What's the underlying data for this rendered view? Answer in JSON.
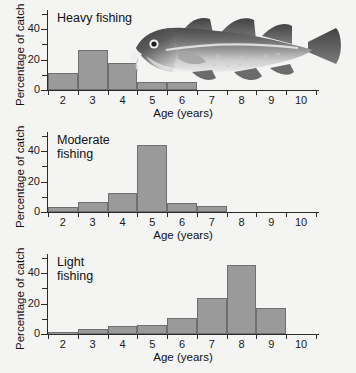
{
  "figure": {
    "background_color": "#f4f4f3",
    "bar_fill_color": "#9a9a9a",
    "bar_edge_color": "#6f6f6f",
    "axis_color": "#2b2b2b"
  },
  "photo": {
    "name": "atlantic-cod-photo",
    "description": "Grayscale photograph of an Atlantic cod"
  },
  "axis_labels": {
    "x": "Age (years)",
    "y": "Percentage of catch"
  },
  "ticks": {
    "y_major": [
      "0",
      "20",
      "40"
    ],
    "y_major_values": [
      0,
      20,
      40
    ],
    "y_minor_values": [
      10,
      30,
      50
    ],
    "x": [
      "2",
      "3",
      "4",
      "5",
      "6",
      "7",
      "8",
      "9",
      "10"
    ],
    "x_values": [
      2,
      3,
      4,
      5,
      6,
      7,
      8,
      9,
      10
    ]
  },
  "chart_data": [
    {
      "type": "bar",
      "title": "Heavy fishing",
      "name": "heavy-fishing-histogram",
      "categories": [
        2,
        3,
        4,
        5,
        6,
        7,
        8,
        9,
        10
      ],
      "values": [
        11,
        26,
        18,
        5,
        5,
        0,
        0,
        0,
        0
      ],
      "xlabel": "Age (years)",
      "ylabel": "Percentage of catch",
      "xlim": [
        1.5,
        10.5
      ],
      "ylim": [
        0,
        50
      ],
      "grid": false,
      "legend": false
    },
    {
      "type": "bar",
      "title": "Moderate\nfishing",
      "name": "moderate-fishing-histogram",
      "categories": [
        2,
        3,
        4,
        5,
        6,
        7,
        8,
        9,
        10
      ],
      "values": [
        3,
        6.5,
        12.5,
        44,
        6,
        4,
        0,
        0,
        0
      ],
      "xlabel": "Age (years)",
      "ylabel": "Percentage of catch",
      "xlim": [
        1.5,
        10.5
      ],
      "ylim": [
        0,
        50
      ],
      "grid": false,
      "legend": false
    },
    {
      "type": "bar",
      "title": "Light\nfishing",
      "name": "light-fishing-histogram",
      "categories": [
        2,
        3,
        4,
        5,
        6,
        7,
        8,
        9,
        10
      ],
      "values": [
        1.5,
        3,
        5,
        6,
        10.5,
        23.5,
        45.5,
        17,
        0
      ],
      "xlabel": "Age (years)",
      "ylabel": "Percentage of catch",
      "xlim": [
        1.5,
        10.5
      ],
      "ylim": [
        0,
        50
      ],
      "grid": false,
      "legend": false
    }
  ]
}
